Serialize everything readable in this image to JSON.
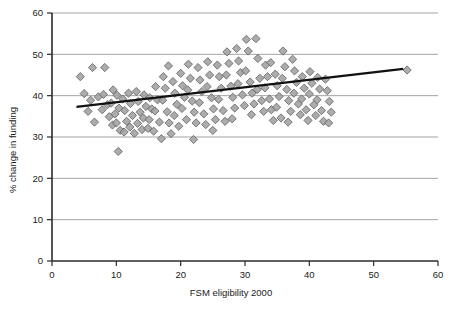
{
  "chart_data": {
    "type": "scatter",
    "title": "",
    "xlabel": "FSM eligibility 2000",
    "ylabel": "% change in funding",
    "xlim": [
      0,
      60
    ],
    "ylim": [
      0,
      60
    ],
    "xticks": [
      0,
      10,
      20,
      30,
      40,
      50,
      60
    ],
    "yticks": [
      0,
      10,
      20,
      30,
      40,
      50,
      60
    ],
    "grid": "horizontal",
    "legend": "none",
    "marker": {
      "shape": "diamond",
      "fill": "#a0a0a0",
      "stroke": "#6b6b6b",
      "size": 7
    },
    "colors": {
      "gridline": "#999999",
      "axis": "#2b2b2b",
      "trendline": "#111111",
      "background": "#ffffff"
    },
    "trendline": {
      "type": "linear",
      "x": [
        3.8,
        54.6
      ],
      "y": [
        37.3,
        46.5
      ],
      "width": 2.2
    },
    "series": [
      {
        "name": "Schools",
        "points": [
          [
            4.4,
            44.6
          ],
          [
            5.0,
            40.5
          ],
          [
            5.6,
            36.2
          ],
          [
            6.3,
            46.8
          ],
          [
            6.0,
            38.9
          ],
          [
            6.6,
            33.6
          ],
          [
            7.2,
            39.7
          ],
          [
            7.8,
            36.6
          ],
          [
            8.2,
            46.8
          ],
          [
            8.0,
            40.3
          ],
          [
            8.6,
            37.8
          ],
          [
            8.9,
            34.9
          ],
          [
            9.2,
            38.2
          ],
          [
            9.5,
            41.4
          ],
          [
            9.8,
            35.6
          ],
          [
            9.4,
            32.9
          ],
          [
            10.1,
            40.1
          ],
          [
            10.4,
            37.0
          ],
          [
            10.0,
            33.4
          ],
          [
            10.6,
            31.6
          ],
          [
            10.3,
            26.5
          ],
          [
            11.0,
            39.2
          ],
          [
            11.3,
            36.4
          ],
          [
            11.6,
            33.8
          ],
          [
            11.2,
            31.2
          ],
          [
            11.9,
            40.6
          ],
          [
            12.2,
            38.1
          ],
          [
            12.5,
            35.2
          ],
          [
            12.1,
            32.4
          ],
          [
            12.8,
            30.9
          ],
          [
            13.1,
            41.0
          ],
          [
            13.4,
            38.6
          ],
          [
            13.7,
            36.0
          ],
          [
            13.3,
            33.3
          ],
          [
            14.0,
            31.8
          ],
          [
            14.3,
            40.2
          ],
          [
            14.6,
            37.4
          ],
          [
            14.2,
            34.6
          ],
          [
            14.9,
            32.1
          ],
          [
            15.2,
            39.5
          ],
          [
            15.5,
            36.8
          ],
          [
            15.1,
            34.2
          ],
          [
            15.8,
            31.4
          ],
          [
            16.1,
            42.2
          ],
          [
            16.4,
            39.0
          ],
          [
            16.0,
            36.3
          ],
          [
            16.7,
            33.6
          ],
          [
            17.0,
            29.6
          ],
          [
            17.3,
            44.6
          ],
          [
            17.6,
            41.8
          ],
          [
            17.2,
            38.9
          ],
          [
            17.9,
            36.1
          ],
          [
            18.2,
            33.4
          ],
          [
            18.5,
            30.8
          ],
          [
            18.1,
            47.2
          ],
          [
            18.8,
            43.4
          ],
          [
            19.1,
            40.6
          ],
          [
            19.4,
            37.9
          ],
          [
            19.0,
            35.2
          ],
          [
            19.7,
            32.6
          ],
          [
            20.0,
            45.4
          ],
          [
            20.3,
            42.4
          ],
          [
            20.6,
            39.6
          ],
          [
            20.2,
            36.9
          ],
          [
            20.9,
            34.2
          ],
          [
            21.2,
            47.6
          ],
          [
            21.5,
            44.2
          ],
          [
            21.1,
            41.4
          ],
          [
            21.8,
            38.7
          ],
          [
            22.1,
            36.0
          ],
          [
            22.4,
            33.4
          ],
          [
            22.0,
            29.4
          ],
          [
            22.7,
            46.8
          ],
          [
            23.0,
            43.8
          ],
          [
            23.3,
            41.0
          ],
          [
            22.9,
            38.3
          ],
          [
            23.6,
            35.6
          ],
          [
            23.9,
            33.0
          ],
          [
            24.2,
            48.2
          ],
          [
            24.5,
            45.0
          ],
          [
            24.1,
            42.2
          ],
          [
            24.8,
            39.5
          ],
          [
            25.1,
            36.8
          ],
          [
            25.4,
            34.2
          ],
          [
            25.0,
            31.6
          ],
          [
            25.7,
            47.4
          ],
          [
            26.0,
            44.6
          ],
          [
            26.3,
            41.8
          ],
          [
            25.9,
            39.1
          ],
          [
            26.6,
            36.4
          ],
          [
            26.9,
            33.8
          ],
          [
            27.2,
            50.6
          ],
          [
            27.5,
            47.8
          ],
          [
            27.1,
            45.0
          ],
          [
            27.8,
            42.3
          ],
          [
            28.1,
            39.6
          ],
          [
            28.4,
            37.0
          ],
          [
            28.0,
            34.4
          ],
          [
            28.7,
            51.4
          ],
          [
            29.0,
            48.4
          ],
          [
            29.3,
            45.6
          ],
          [
            28.9,
            42.9
          ],
          [
            29.6,
            40.2
          ],
          [
            29.9,
            37.6
          ],
          [
            30.2,
            53.6
          ],
          [
            30.5,
            50.8
          ],
          [
            30.1,
            46.0
          ],
          [
            30.8,
            43.3
          ],
          [
            31.1,
            40.6
          ],
          [
            31.4,
            38.0
          ],
          [
            31.0,
            35.4
          ],
          [
            31.7,
            53.8
          ],
          [
            32.0,
            49.0
          ],
          [
            32.3,
            44.2
          ],
          [
            31.9,
            41.5
          ],
          [
            32.6,
            38.8
          ],
          [
            32.9,
            36.2
          ],
          [
            33.2,
            47.4
          ],
          [
            33.5,
            44.6
          ],
          [
            33.1,
            41.9
          ],
          [
            33.8,
            39.2
          ],
          [
            34.1,
            36.6
          ],
          [
            34.4,
            34.0
          ],
          [
            34.0,
            48.0
          ],
          [
            34.7,
            45.2
          ],
          [
            35.0,
            42.4
          ],
          [
            35.3,
            39.8
          ],
          [
            34.9,
            37.2
          ],
          [
            35.6,
            34.6
          ],
          [
            35.9,
            50.8
          ],
          [
            36.2,
            47.0
          ],
          [
            35.8,
            44.2
          ],
          [
            36.5,
            41.5
          ],
          [
            36.8,
            38.8
          ],
          [
            37.1,
            36.2
          ],
          [
            36.7,
            33.6
          ],
          [
            37.4,
            48.8
          ],
          [
            37.7,
            46.0
          ],
          [
            38.0,
            43.2
          ],
          [
            37.6,
            40.6
          ],
          [
            38.3,
            38.0
          ],
          [
            38.6,
            35.4
          ],
          [
            38.9,
            44.6
          ],
          [
            39.2,
            41.8
          ],
          [
            38.8,
            39.2
          ],
          [
            39.5,
            36.6
          ],
          [
            39.8,
            34.0
          ],
          [
            40.1,
            45.8
          ],
          [
            40.4,
            43.0
          ],
          [
            40.0,
            40.4
          ],
          [
            40.7,
            37.8
          ],
          [
            41.0,
            35.2
          ],
          [
            41.3,
            44.4
          ],
          [
            41.6,
            41.6
          ],
          [
            41.2,
            39.0
          ],
          [
            41.9,
            36.4
          ],
          [
            42.2,
            33.8
          ],
          [
            42.5,
            44.0
          ],
          [
            42.8,
            41.2
          ],
          [
            43.1,
            38.6
          ],
          [
            43.4,
            36.0
          ],
          [
            43.0,
            33.4
          ],
          [
            55.2,
            46.2
          ]
        ]
      }
    ]
  }
}
